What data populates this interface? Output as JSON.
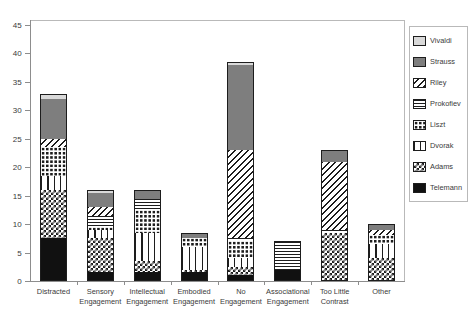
{
  "chart_data": {
    "type": "bar",
    "subtype": "stacked-bar",
    "title": "",
    "xlabel": "",
    "ylabel": "",
    "ylim": [
      0,
      45
    ],
    "ytick_step": 5,
    "yticks": [
      0,
      5,
      10,
      15,
      20,
      25,
      30,
      35,
      40,
      45
    ],
    "grid": false,
    "legend_position": "right",
    "categories": [
      "Distracted",
      "Sensory Engagement",
      "Intellectual Engagement",
      "Embodied Engagement",
      "No Engagement",
      "Associational Engagement",
      "Too Little Contrast",
      "Other"
    ],
    "category_lines": [
      [
        "Distracted"
      ],
      [
        "Sensory",
        "Engagement"
      ],
      [
        "Intellectual",
        "Engagement"
      ],
      [
        "Embodied",
        "Engagement"
      ],
      [
        "No",
        "Engagement"
      ],
      [
        "Associational",
        "Engagement"
      ],
      [
        "Too Little",
        "Contrast"
      ],
      [
        "Other"
      ]
    ],
    "series": [
      {
        "name": "Telemann",
        "pattern": "solid-black",
        "values": [
          7.5,
          1.5,
          1.5,
          1.5,
          1.0,
          2.0,
          0.0,
          0.0
        ]
      },
      {
        "name": "Adams",
        "pattern": "checkerboard-large",
        "values": [
          8.5,
          6.0,
          2.0,
          0.5,
          1.5,
          0.0,
          8.5,
          4.0
        ]
      },
      {
        "name": "Dvorak",
        "pattern": "grid-crosshatch",
        "values": [
          2.5,
          1.5,
          5.0,
          4.0,
          1.5,
          0.0,
          0.0,
          2.5
        ]
      },
      {
        "name": "Liszt",
        "pattern": "dots-small",
        "values": [
          5.0,
          0.5,
          4.0,
          1.5,
          3.0,
          0.0,
          0.0,
          1.5
        ]
      },
      {
        "name": "Prokofiev",
        "pattern": "horizontal-lines",
        "values": [
          0.0,
          2.0,
          2.0,
          0.0,
          0.5,
          5.0,
          0.5,
          0.0
        ]
      },
      {
        "name": "Riley",
        "pattern": "diagonal-stripes",
        "values": [
          1.5,
          1.5,
          0.0,
          0.0,
          15.5,
          0.0,
          12.0,
          1.0
        ]
      },
      {
        "name": "Strauss",
        "pattern": "solid-gray",
        "values": [
          7.0,
          2.5,
          1.5,
          1.0,
          15.0,
          0.0,
          2.0,
          1.0
        ]
      },
      {
        "name": "Vivaldi",
        "pattern": "solid-light-gray",
        "values": [
          0.8,
          0.5,
          0.0,
          0.0,
          0.5,
          0.0,
          0.0,
          0.0
        ]
      }
    ],
    "totals": [
      32.8,
      16.0,
      16.0,
      8.5,
      38.5,
      7.0,
      23.0,
      10.0
    ]
  },
  "legend": {
    "items": [
      {
        "label": "Vivaldi",
        "pattern": "solid-light-gray"
      },
      {
        "label": "Strauss",
        "pattern": "solid-gray"
      },
      {
        "label": "Riley",
        "pattern": "diagonal-stripes"
      },
      {
        "label": "Prokofiev",
        "pattern": "horizontal-lines"
      },
      {
        "label": "Liszt",
        "pattern": "dots-small"
      },
      {
        "label": "Dvorak",
        "pattern": "grid-crosshatch"
      },
      {
        "label": "Adams",
        "pattern": "checkerboard-large"
      },
      {
        "label": "Telemann",
        "pattern": "solid-black"
      }
    ]
  },
  "colors": {
    "axis": "#8d8d8d",
    "frame": "#b9b9b9",
    "text": "#3a3a3a",
    "stroke": "#1d1d1d",
    "black": "#111111",
    "gray": "#7e7e7e",
    "light_gray": "#d9d9d9",
    "background": "#ffffff"
  }
}
